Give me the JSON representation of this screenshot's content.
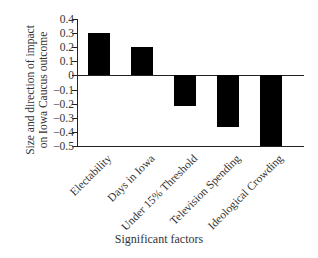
{
  "chart_data": {
    "type": "bar",
    "title": "",
    "xlabel": "Significant factors",
    "ylabel": "Size and direction of impact on Iowa Caucus outcome",
    "ylabel_lines": [
      "Size and direction of impact",
      "on Iowa Caucus outcome"
    ],
    "categories": [
      "Electability",
      "Days in Iowa",
      "Under 15% Threshold",
      "Television Spending",
      "Ideological Crowding"
    ],
    "values": [
      0.3,
      0.2,
      -0.22,
      -0.37,
      -0.5
    ],
    "ylim": [
      -0.5,
      0.4
    ],
    "yticks": [
      "0.4",
      "0.3",
      "0.2",
      "0.1",
      "0",
      "-0.1",
      "-0.2",
      "-0.3",
      "-0.4",
      "-0.5"
    ],
    "grid": false,
    "legend": null,
    "bar_color": "#000000"
  }
}
